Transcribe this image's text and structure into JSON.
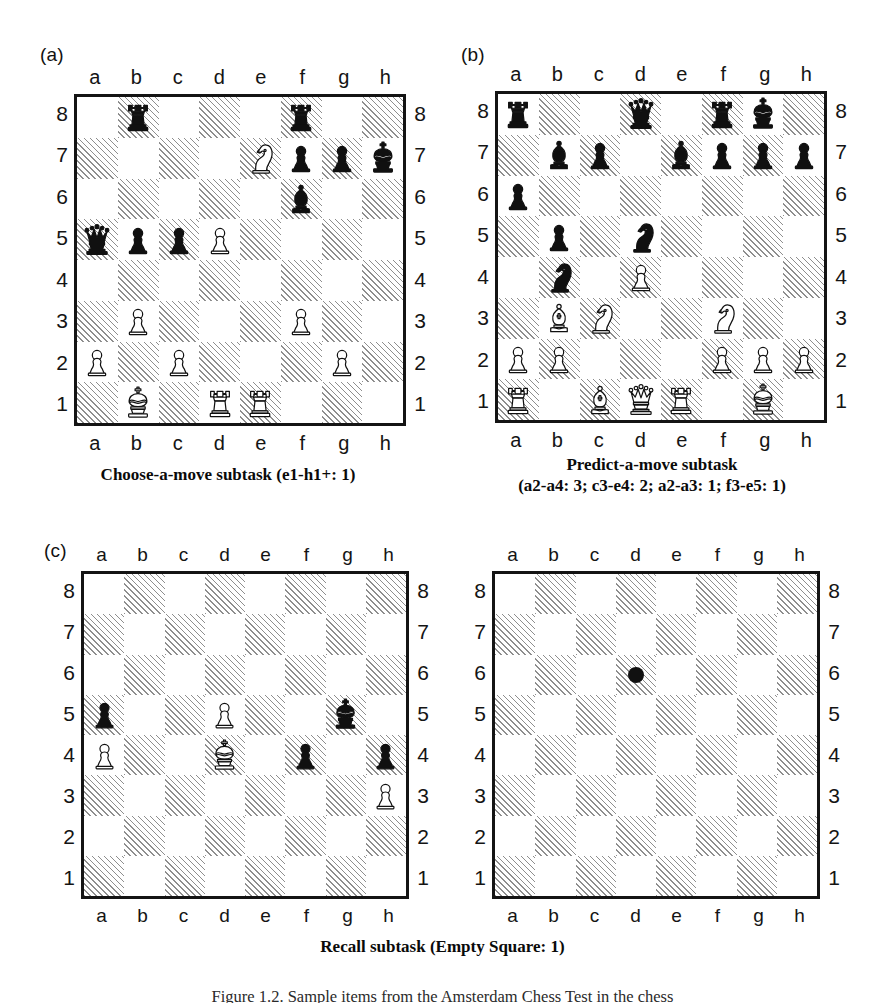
{
  "figure": {
    "panel_a_tag": "(a)",
    "panel_b_tag": "(b)",
    "panel_c_tag": "(c)",
    "bottom_caption": "Figure 1.2. Sample items from the Amsterdam Chess Test in the chess"
  },
  "coords": {
    "files": [
      "a",
      "b",
      "c",
      "d",
      "e",
      "f",
      "g",
      "h"
    ],
    "ranks": [
      "8",
      "7",
      "6",
      "5",
      "4",
      "3",
      "2",
      "1"
    ]
  },
  "colors": {
    "ink": "#141414",
    "light_square": "#ffffff",
    "dark_square_hatch": "#8e8e8e",
    "marker": "#111111"
  },
  "boards": {
    "a": {
      "label": "(a)",
      "caption_line1": "Choose-a-move subtask (e1-h1+: 1)",
      "caption_line2": "",
      "pieces": [
        {
          "square": "b8",
          "color": "black",
          "type": "rook"
        },
        {
          "square": "f8",
          "color": "black",
          "type": "rook"
        },
        {
          "square": "e7",
          "color": "white",
          "type": "knight"
        },
        {
          "square": "f7",
          "color": "black",
          "type": "pawn"
        },
        {
          "square": "g7",
          "color": "black",
          "type": "pawn"
        },
        {
          "square": "h7",
          "color": "black",
          "type": "king"
        },
        {
          "square": "f6",
          "color": "black",
          "type": "bishop"
        },
        {
          "square": "a5",
          "color": "black",
          "type": "queen"
        },
        {
          "square": "b5",
          "color": "black",
          "type": "pawn"
        },
        {
          "square": "c5",
          "color": "black",
          "type": "pawn"
        },
        {
          "square": "d5",
          "color": "white",
          "type": "pawn"
        },
        {
          "square": "b3",
          "color": "white",
          "type": "pawn"
        },
        {
          "square": "f3",
          "color": "white",
          "type": "pawn"
        },
        {
          "square": "a2",
          "color": "white",
          "type": "pawn"
        },
        {
          "square": "c2",
          "color": "white",
          "type": "pawn"
        },
        {
          "square": "g2",
          "color": "white",
          "type": "pawn"
        },
        {
          "square": "b1",
          "color": "white",
          "type": "king"
        },
        {
          "square": "d1",
          "color": "white",
          "type": "rook"
        },
        {
          "square": "e1",
          "color": "white",
          "type": "rook"
        }
      ],
      "markers": []
    },
    "b": {
      "label": "(b)",
      "caption_line1": "Predict-a-move subtask",
      "caption_line2": "(a2-a4: 3; c3-e4: 2; a2-a3: 1; f3-e5: 1)",
      "pieces": [
        {
          "square": "a8",
          "color": "black",
          "type": "rook"
        },
        {
          "square": "d8",
          "color": "black",
          "type": "queen"
        },
        {
          "square": "f8",
          "color": "black",
          "type": "rook"
        },
        {
          "square": "g8",
          "color": "black",
          "type": "king"
        },
        {
          "square": "b7",
          "color": "black",
          "type": "bishop"
        },
        {
          "square": "c7",
          "color": "black",
          "type": "pawn"
        },
        {
          "square": "e7",
          "color": "black",
          "type": "bishop"
        },
        {
          "square": "f7",
          "color": "black",
          "type": "pawn"
        },
        {
          "square": "g7",
          "color": "black",
          "type": "pawn"
        },
        {
          "square": "h7",
          "color": "black",
          "type": "pawn"
        },
        {
          "square": "a6",
          "color": "black",
          "type": "pawn"
        },
        {
          "square": "b5",
          "color": "black",
          "type": "pawn"
        },
        {
          "square": "d5",
          "color": "black",
          "type": "knight"
        },
        {
          "square": "b4",
          "color": "black",
          "type": "knight"
        },
        {
          "square": "d4",
          "color": "white",
          "type": "pawn"
        },
        {
          "square": "b3",
          "color": "white",
          "type": "bishop"
        },
        {
          "square": "c3",
          "color": "white",
          "type": "knight"
        },
        {
          "square": "f3",
          "color": "white",
          "type": "knight"
        },
        {
          "square": "a2",
          "color": "white",
          "type": "pawn"
        },
        {
          "square": "b2",
          "color": "white",
          "type": "pawn"
        },
        {
          "square": "f2",
          "color": "white",
          "type": "pawn"
        },
        {
          "square": "g2",
          "color": "white",
          "type": "pawn"
        },
        {
          "square": "h2",
          "color": "white",
          "type": "pawn"
        },
        {
          "square": "a1",
          "color": "white",
          "type": "rook"
        },
        {
          "square": "c1",
          "color": "white",
          "type": "bishop"
        },
        {
          "square": "d1",
          "color": "white",
          "type": "queen"
        },
        {
          "square": "e1",
          "color": "white",
          "type": "rook"
        },
        {
          "square": "g1",
          "color": "white",
          "type": "king"
        }
      ],
      "markers": []
    },
    "c_left": {
      "label": "(c)",
      "caption_line1": "Recall subtask (Empty Square: 1)",
      "caption_line2": "",
      "pieces": [
        {
          "square": "a5",
          "color": "black",
          "type": "pawn"
        },
        {
          "square": "d5",
          "color": "white",
          "type": "pawn"
        },
        {
          "square": "g5",
          "color": "black",
          "type": "king"
        },
        {
          "square": "a4",
          "color": "white",
          "type": "pawn"
        },
        {
          "square": "d4",
          "color": "white",
          "type": "king"
        },
        {
          "square": "f4",
          "color": "black",
          "type": "pawn"
        },
        {
          "square": "h4",
          "color": "black",
          "type": "pawn"
        },
        {
          "square": "h3",
          "color": "white",
          "type": "pawn"
        }
      ],
      "markers": []
    },
    "c_right": {
      "label": "",
      "caption_line1": "",
      "caption_line2": "",
      "pieces": [],
      "markers": [
        {
          "square": "d6",
          "kind": "dot"
        }
      ]
    }
  }
}
